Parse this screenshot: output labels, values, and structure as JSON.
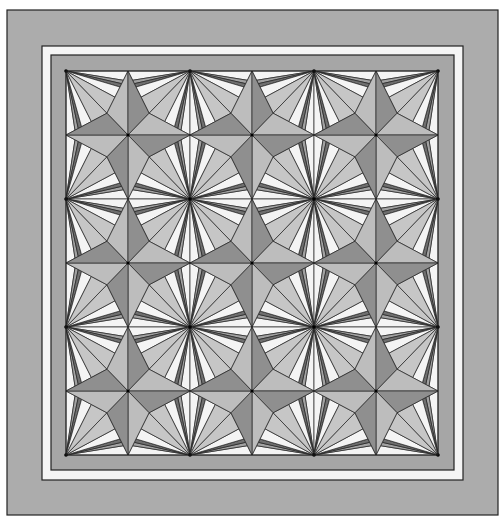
{
  "quilt": {
    "title": "Star and spoke quilt pattern",
    "canvas": {
      "width": 501,
      "height": 524,
      "background": "#ffffff"
    },
    "borders": [
      {
        "name": "outer-border",
        "x": 7,
        "y": 10,
        "w": 491,
        "h": 505,
        "fill": "#acacac"
      },
      {
        "name": "white-border",
        "x": 42,
        "y": 46,
        "w": 421,
        "h": 434,
        "fill": "#f5f5f5"
      },
      {
        "name": "inner-border",
        "x": 51,
        "y": 55,
        "w": 403,
        "h": 415,
        "fill": "#a6a6a6"
      }
    ],
    "field": {
      "x": 66,
      "y": 71,
      "w": 372,
      "h": 384,
      "cols": 3,
      "rows": 3
    },
    "colors": {
      "white": "#f4f4f4",
      "light": "#c6c6c6",
      "star_light": "#bdbdbd",
      "star_dark": "#8f8f8f",
      "strip_mid": "#a2a2a2",
      "strip_dark": "#6f6f6f",
      "line": "#222222"
    }
  }
}
